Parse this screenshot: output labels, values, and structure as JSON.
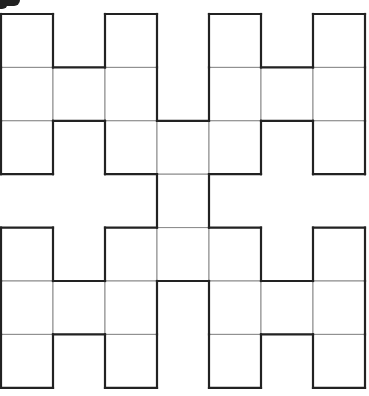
{
  "diagram": {
    "title": "",
    "grid": {
      "cols": 7,
      "rows": 7,
      "origin_x": 1,
      "origin_y": 14,
      "cell_w": 52,
      "cell_h": 53.4
    },
    "colors": {
      "outline": "#222222",
      "inner_line": "#8a8a8a",
      "fill": "#ffffff"
    },
    "filled_cells": [
      [
        0,
        0
      ],
      [
        0,
        2
      ],
      [
        0,
        4
      ],
      [
        0,
        6
      ],
      [
        1,
        0
      ],
      [
        1,
        1
      ],
      [
        1,
        2
      ],
      [
        1,
        4
      ],
      [
        1,
        5
      ],
      [
        1,
        6
      ],
      [
        2,
        0
      ],
      [
        2,
        2
      ],
      [
        2,
        3
      ],
      [
        2,
        4
      ],
      [
        2,
        6
      ],
      [
        3,
        3
      ],
      [
        4,
        0
      ],
      [
        4,
        2
      ],
      [
        4,
        3
      ],
      [
        4,
        4
      ],
      [
        4,
        6
      ],
      [
        5,
        0
      ],
      [
        5,
        1
      ],
      [
        5,
        2
      ],
      [
        5,
        4
      ],
      [
        5,
        5
      ],
      [
        5,
        6
      ],
      [
        6,
        0
      ],
      [
        6,
        2
      ],
      [
        6,
        4
      ],
      [
        6,
        6
      ]
    ],
    "smudge": "ink-blot-top-left"
  }
}
